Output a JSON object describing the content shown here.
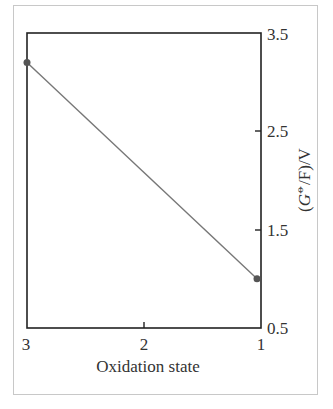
{
  "chart_data": {
    "type": "line",
    "title": "",
    "xlabel": "Oxidation state",
    "ylabel": "(G⦵/F)/V",
    "ylabel_parts": {
      "open": "(",
      "G": "G",
      "sup": "⦵",
      "rest": "/F)/V"
    },
    "x": [
      3,
      1
    ],
    "series": [
      {
        "name": "",
        "values": [
          3.2,
          1.0
        ],
        "color": "#777777"
      }
    ],
    "xlim": [
      3,
      1
    ],
    "ylim": [
      0.5,
      3.5
    ],
    "x_ticks": [
      "3",
      "2",
      "1"
    ],
    "y_ticks": [
      "3.5",
      "2.5",
      "1.5",
      "0.5"
    ],
    "y_axis_position": "right",
    "grid": false,
    "legend": null
  },
  "colors": {
    "axis": "#222222",
    "line": "#777777",
    "marker": "#555555",
    "frame": "#c8c8c8"
  }
}
